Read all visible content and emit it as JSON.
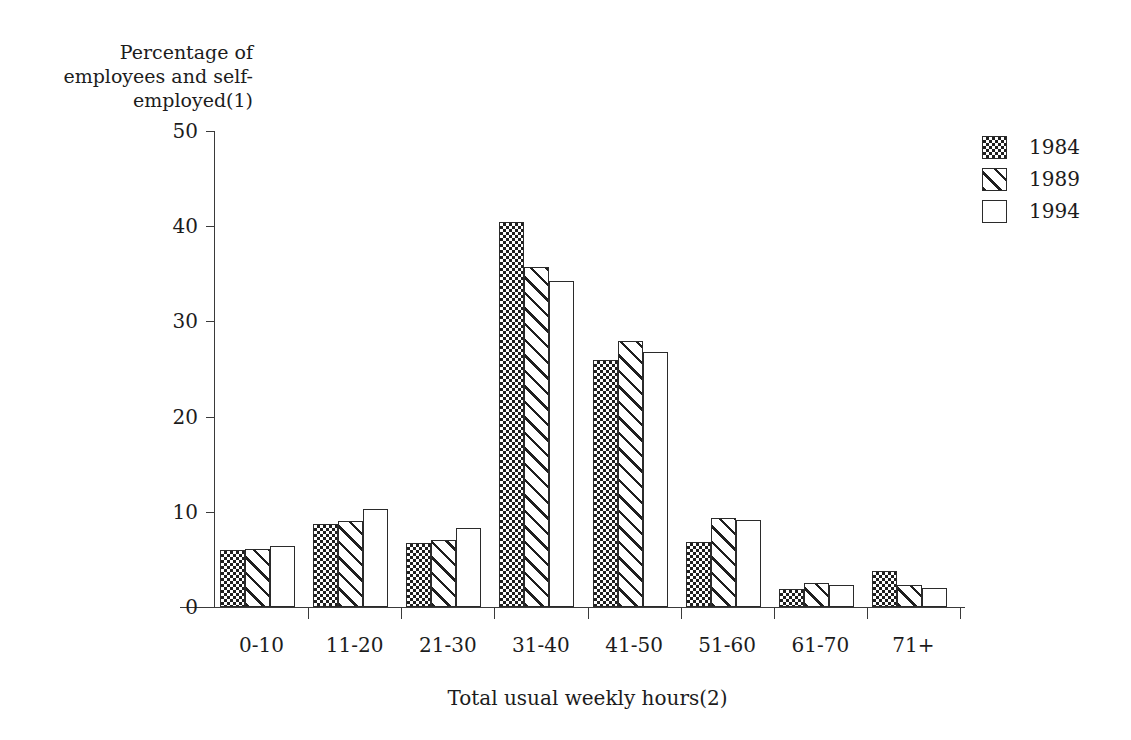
{
  "chart_data": {
    "type": "bar",
    "title": "",
    "xlabel": "Total usual weekly hours(2)",
    "ylabel": "Percentage of\nemployees and self-\nemployed(1)",
    "categories": [
      "0-10",
      "11-20",
      "21-30",
      "31-40",
      "41-50",
      "51-60",
      "61-70",
      "71+"
    ],
    "series": [
      {
        "name": "1984",
        "pattern": "checker",
        "values": [
          6.0,
          8.7,
          6.7,
          40.4,
          25.9,
          6.8,
          1.9,
          3.8
        ]
      },
      {
        "name": "1989",
        "pattern": "diagonal",
        "values": [
          6.1,
          9.0,
          7.0,
          35.7,
          27.9,
          9.3,
          2.5,
          2.3
        ]
      },
      {
        "name": "1994",
        "pattern": "blank",
        "values": [
          6.4,
          10.3,
          8.3,
          34.2,
          26.8,
          9.1,
          2.3,
          2.0
        ]
      }
    ],
    "yticks": [
      0,
      10,
      20,
      30,
      40,
      50
    ],
    "ylim": [
      0,
      50
    ],
    "grid": false,
    "legend_position": "top-right",
    "colors": {
      "axis": "#3a3a3a",
      "bar_outline": "#2b2b2b",
      "pattern_ink": "#1f1f1f",
      "background": "#ffffff",
      "text": "#1c1c1c"
    }
  },
  "legend": {
    "items": [
      {
        "label": "1984"
      },
      {
        "label": "1989"
      },
      {
        "label": "1994"
      }
    ]
  }
}
